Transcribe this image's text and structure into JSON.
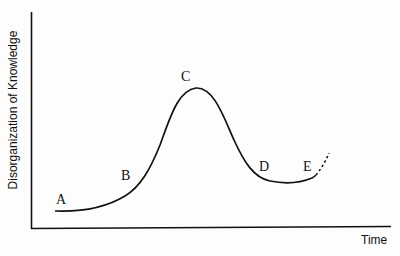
{
  "diagram": {
    "y_axis_label": "Disorganization of Knowledge",
    "x_axis_label": "Time",
    "points": [
      {
        "label": "A"
      },
      {
        "label": "B"
      },
      {
        "label": "C"
      },
      {
        "label": "D"
      },
      {
        "label": "E"
      }
    ],
    "line_color": "#111111"
  }
}
